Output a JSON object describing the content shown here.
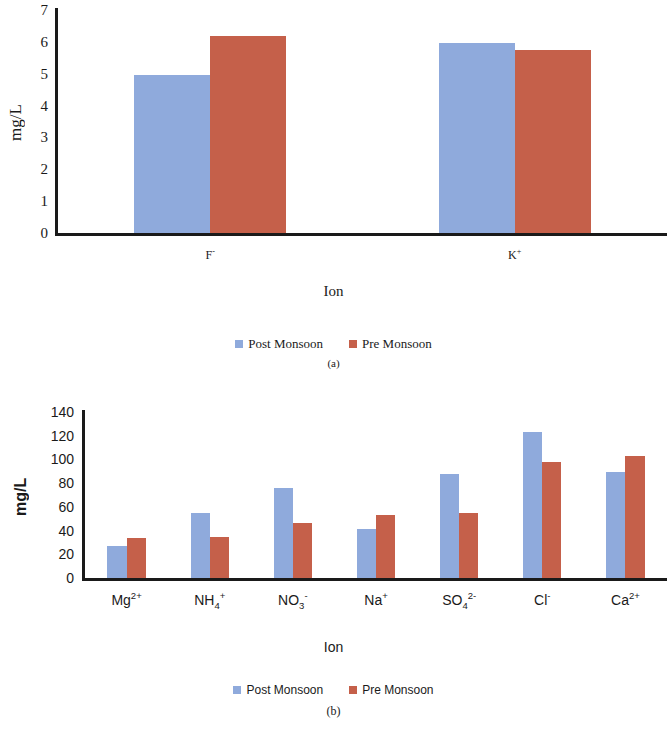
{
  "figures": [
    {
      "id": "a",
      "caption": "(a)",
      "ylabel": "mg/L",
      "xlabel": "Ion",
      "legend": [
        {
          "label": "Post Monsoon",
          "color": "#8faadc",
          "key": "post"
        },
        {
          "label": "Pre Monsoon",
          "color": "#c5604a",
          "key": "pre"
        }
      ]
    },
    {
      "id": "b",
      "caption": "(b)",
      "ylabel": "mg/L",
      "xlabel": "Ion",
      "legend": [
        {
          "label": "Post Monsoon",
          "color": "#8faadc",
          "key": "post"
        },
        {
          "label": "Pre Monsoon",
          "color": "#c5604a",
          "key": "pre"
        }
      ]
    }
  ],
  "chart_data": [
    {
      "type": "bar",
      "title": "(a)",
      "xlabel": "Ion",
      "ylabel": "mg/L",
      "ylim": [
        0,
        7
      ],
      "yticks": [
        0,
        1,
        2,
        3,
        4,
        5,
        6,
        7
      ],
      "grid": false,
      "legend_position": "bottom",
      "note": "plot area is cropped at the right edge of the image",
      "categories": [
        "F-",
        "K+"
      ],
      "category_labels_html": [
        "F<sup>-</sup>",
        "K<sup>+</sup>"
      ],
      "series": [
        {
          "name": "Post Monsoon",
          "color": "#8faadc",
          "values": [
            4.95,
            5.95
          ]
        },
        {
          "name": "Pre Monsoon",
          "color": "#c5604a",
          "values": [
            6.2,
            5.75
          ]
        }
      ]
    },
    {
      "type": "bar",
      "title": "(b)",
      "xlabel": "Ion",
      "ylabel": "mg/L",
      "ylim": [
        0,
        140
      ],
      "yticks": [
        0,
        20,
        40,
        60,
        80,
        100,
        120,
        140
      ],
      "grid": false,
      "legend_position": "bottom",
      "categories": [
        "Mg2+",
        "NH4+",
        "NO3-",
        "Na+",
        "SO42-",
        "Cl-",
        "Ca2+"
      ],
      "category_labels_html": [
        "Mg<sup>2+</sup>",
        "NH<sub>4</sub><sup>+</sup>",
        "NO<sub>3</sub><sup>-</sup>",
        "Na<sup>+</sup>",
        "SO<sub>4</sub><sup>2-</sup>",
        "Cl<sup>-</sup>",
        "Ca<sup>2+</sup>"
      ],
      "series": [
        {
          "name": "Post Monsoon",
          "color": "#8faadc",
          "values": [
            27,
            55,
            76,
            41,
            88,
            123,
            89
          ]
        },
        {
          "name": "Pre Monsoon",
          "color": "#c5604a",
          "values": [
            34,
            35,
            46,
            53,
            55,
            98,
            103
          ]
        }
      ]
    }
  ]
}
